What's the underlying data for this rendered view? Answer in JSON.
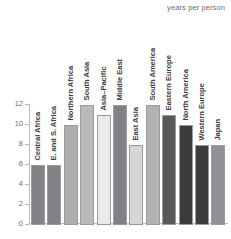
{
  "header": {
    "unit_note": "years per person"
  },
  "chart_data": {
    "type": "bar",
    "title": "",
    "subtitle": "",
    "xlabel": "",
    "ylabel": "years per person",
    "ylim": [
      0,
      12
    ],
    "grid": false,
    "legend": "none",
    "yticks": [
      0,
      2,
      4,
      6,
      8,
      10,
      12
    ],
    "ytick_labels": [
      "0",
      "2",
      "4",
      "6",
      "8",
      "10",
      "12"
    ],
    "categories": [
      "Central Africa",
      "E. and S. Africa",
      "Northern Africa",
      "South Asia",
      "Asia–Pacific",
      "Middle East",
      "East Asia",
      "South America",
      "Eastern Europe",
      "North America",
      "Western Europe",
      "Japan"
    ],
    "values": [
      6,
      6,
      10,
      12,
      11,
      12,
      8,
      12,
      11,
      10,
      8,
      8
    ],
    "bar_colors": [
      "#808285",
      "#808285",
      "#acaeb0",
      "#b8babc",
      "#e9eaec",
      "#808285",
      "#d4d6d8",
      "#b0b2b4",
      "#58595b",
      "#3a3b3d",
      "#3a3b3d",
      "#8f9194"
    ],
    "bar_edge_color": "#9a9b9d",
    "axis_color": "#b9babc",
    "background_color": "#ffffff",
    "label_color": "#3f4042"
  }
}
